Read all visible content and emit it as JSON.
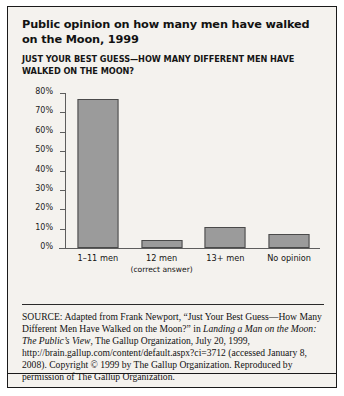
{
  "figure": {
    "title": "Public opinion on how many men have walked on the Moon, 1999",
    "subtitle": "JUST YOUR BEST GUESS—HOW MANY DIFFERENT MEN HAVE WALKED ON THE MOON?",
    "source_lead": "SOURCE:",
    "source_text_1": " Adapted from Frank Newport, “Just Your Best Guess—How Many Different Men Have Walked on the Moon?” in ",
    "source_italic_1": "Landing a Man on the Moon: The Public’s View",
    "source_text_2": ", The Gallup Organization, July 20, 1999, http://brain.gallup.com/content/default.aspx?ci=3712 (accessed January 8, 2008). Copyright © 1999 by The Gallup Organization. Reproduced by permission of The Gallup Organization."
  },
  "chart_data": {
    "type": "bar",
    "title": "Public opinion on how many men have walked on the Moon, 1999",
    "subtitle": "JUST YOUR BEST GUESS—HOW MANY DIFFERENT MEN HAVE WALKED ON THE MOON?",
    "categories": [
      "1–11 men",
      "12 men",
      "13+ men",
      "No opinion"
    ],
    "category_sublabels": [
      "",
      "(correct answer)",
      "",
      ""
    ],
    "values": [
      77,
      4,
      11,
      7
    ],
    "xlabel": "",
    "ylabel": "",
    "ylim": [
      0,
      80
    ],
    "yticks": [
      0,
      10,
      20,
      30,
      40,
      50,
      60,
      70,
      80
    ],
    "ytick_labels": [
      "0%",
      "10%",
      "20%",
      "30%",
      "40%",
      "50%",
      "60%",
      "70%",
      "80%"
    ],
    "grid": false,
    "legend": false,
    "bar_fill": "#9b9b9b",
    "bar_border": "#4a4a4a",
    "axis_color": "#5d5d5d",
    "background": "#f4f2ee"
  }
}
